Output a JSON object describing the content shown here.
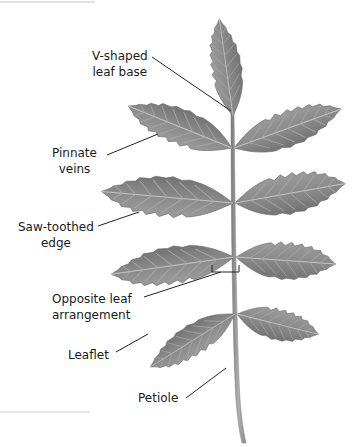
{
  "figure": {
    "colors": {
      "background": "#ffffff",
      "leaf_fill": "#8a8a8a",
      "leaf_dark": "#6f6f6f",
      "vein": "#b5b5b5",
      "stem": "#9a9a9a",
      "leader_line": "#222222",
      "text": "#1a1a1a"
    },
    "labels": [
      {
        "id": "v-shaped-leaf-base",
        "line1": "V-shaped",
        "line2": "leaf base"
      },
      {
        "id": "pinnate-veins",
        "line1": "Pinnate",
        "line2": "veins"
      },
      {
        "id": "saw-toothed-edge",
        "line1": "Saw-toothed",
        "line2": "edge"
      },
      {
        "id": "opposite-leaf-arrangement",
        "line1": "Opposite leaf",
        "line2": "arrangement"
      },
      {
        "id": "leaflet",
        "line1": "Leaflet"
      },
      {
        "id": "petiole",
        "line1": "Petiole"
      }
    ]
  }
}
